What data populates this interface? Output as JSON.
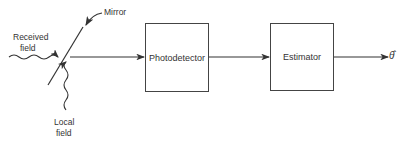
{
  "diagram": {
    "type": "block-diagram",
    "labels": {
      "mirror": "Mirror",
      "received_field_line1": "Received",
      "received_field_line2": "field",
      "local_field_line1": "Local",
      "local_field_line2": "field",
      "output": "θ̂"
    },
    "blocks": [
      {
        "id": "photodetector",
        "label": "Photodetector"
      },
      {
        "id": "estimator",
        "label": "Estimator"
      }
    ],
    "edges": [
      {
        "from": "mirror",
        "to": "photodetector"
      },
      {
        "from": "photodetector",
        "to": "estimator"
      },
      {
        "from": "estimator",
        "to": "output"
      }
    ]
  }
}
